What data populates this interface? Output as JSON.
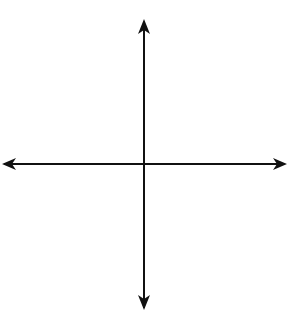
{
  "chart_data": {
    "type": "line",
    "title": "",
    "xlabel": "x",
    "ylabel": "y",
    "origin_label": "O",
    "xlim": [
      -5,
      5
    ],
    "ylim": [
      -5.3,
      5.1
    ],
    "grid": true,
    "x_ticks": [
      "-4",
      "-2",
      "2",
      "4"
    ],
    "y_ticks": [
      "4",
      "2",
      "-2"
    ],
    "series": [
      {
        "name": "f",
        "formula": "y = cbrt(x)",
        "color": "#555555",
        "points": [
          [
            -5,
            -1.71
          ],
          [
            -4,
            -1.59
          ],
          [
            -2,
            -1.26
          ],
          [
            -1,
            -1
          ],
          [
            0,
            0
          ],
          [
            1,
            1
          ],
          [
            2,
            1.26
          ],
          [
            4,
            1.59
          ],
          [
            5,
            1.71
          ]
        ]
      },
      {
        "name": "g",
        "formula": "y = 4*cbrt(x)",
        "color": "#8a8a8a",
        "points": [
          [
            -1.9,
            -4.95
          ],
          [
            -1,
            -4
          ],
          [
            -0.125,
            -2
          ],
          [
            0,
            0
          ],
          [
            0.125,
            2
          ],
          [
            1,
            4
          ],
          [
            1.9,
            4.95
          ]
        ]
      }
    ],
    "labels": {
      "f": "f",
      "g": "g",
      "x_axis": "x",
      "y_axis": "y"
    }
  }
}
